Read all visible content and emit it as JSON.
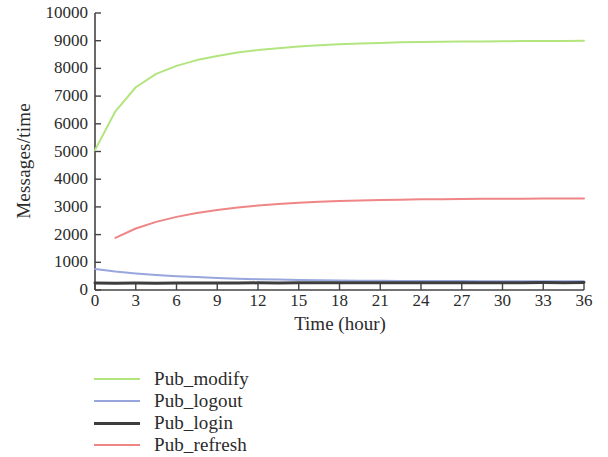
{
  "chart_data": {
    "type": "line",
    "title": "",
    "subtitle": "",
    "xlabel": "Time (hour)",
    "ylabel": "Messages/time",
    "xlim": [
      0,
      36
    ],
    "ylim": [
      0,
      10000
    ],
    "xticks": [
      "0",
      "3",
      "6",
      "9",
      "12",
      "15",
      "18",
      "21",
      "24",
      "27",
      "30",
      "33",
      "36"
    ],
    "xtick_values": [
      0,
      3,
      6,
      9,
      12,
      15,
      18,
      21,
      24,
      27,
      30,
      33,
      36
    ],
    "yticks": [
      "0",
      "1000",
      "2000",
      "3000",
      "4000",
      "5000",
      "6000",
      "7000",
      "8000",
      "9000",
      "10000"
    ],
    "ytick_values": [
      0,
      1000,
      2000,
      3000,
      4000,
      5000,
      6000,
      7000,
      8000,
      9000,
      10000
    ],
    "grid": false,
    "legend_position": "below-left",
    "x": [
      0,
      1.5,
      3,
      4.5,
      6,
      7.5,
      9,
      10.5,
      12,
      13.5,
      15,
      16.5,
      18,
      19.5,
      21,
      22.5,
      24,
      25.5,
      27,
      28.5,
      30,
      31.5,
      33,
      34.5,
      36
    ],
    "series": [
      {
        "name": "Pub_modify",
        "color": "#b3e57f",
        "x_start": 0,
        "values": [
          5050,
          6450,
          7320,
          7800,
          8090,
          8300,
          8450,
          8570,
          8660,
          8730,
          8790,
          8840,
          8870,
          8900,
          8920,
          8940,
          8950,
          8960,
          8970,
          8975,
          8980,
          8985,
          8988,
          8990,
          8995
        ]
      },
      {
        "name": "Pub_logout",
        "color": "#97a6dd",
        "x_start": 0,
        "values": [
          760,
          670,
          600,
          545,
          500,
          465,
          435,
          410,
          390,
          375,
          362,
          352,
          344,
          338,
          333,
          329,
          326,
          323,
          321,
          319,
          318,
          317,
          316,
          315,
          315
        ]
      },
      {
        "name": "Pub_login",
        "color": "#3d3d3d",
        "x_start": 0,
        "values": [
          250,
          245,
          250,
          248,
          252,
          250,
          255,
          252,
          258,
          255,
          260,
          258,
          262,
          260,
          263,
          261,
          264,
          262,
          265,
          263,
          266,
          264,
          267,
          265,
          268
        ]
      },
      {
        "name": "Pub_refresh",
        "color": "#ef8585",
        "x_start": 1.5,
        "values": [
          null,
          1880,
          2220,
          2460,
          2640,
          2780,
          2890,
          2980,
          3050,
          3105,
          3150,
          3185,
          3212,
          3233,
          3249,
          3262,
          3272,
          3280,
          3286,
          3291,
          3295,
          3298,
          3300,
          3302,
          3305
        ]
      }
    ]
  },
  "axes": {
    "ylabel": "Messages/time",
    "xlabel": "Time (hour)"
  },
  "legend": {
    "items": [
      {
        "label": "Pub_modify",
        "color": "#b3e57f",
        "thickness": 2
      },
      {
        "label": "Pub_logout",
        "color": "#97a6dd",
        "thickness": 2
      },
      {
        "label": "Pub_login",
        "color": "#3d3d3d",
        "thickness": 3
      },
      {
        "label": "Pub_refresh",
        "color": "#ef8585",
        "thickness": 2
      }
    ]
  }
}
